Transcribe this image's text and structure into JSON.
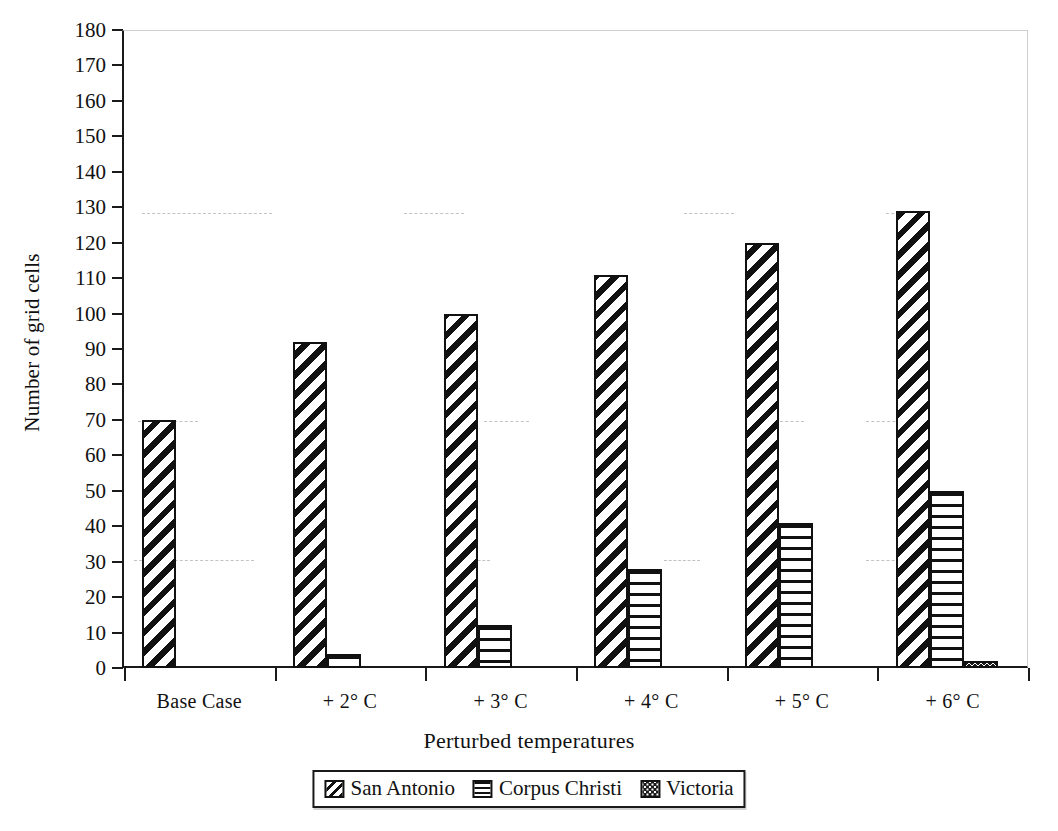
{
  "chart_data": {
    "type": "bar",
    "title": "",
    "xlabel": "Perturbed temperatures",
    "ylabel": "Number of grid cells",
    "ylim": [
      0,
      180
    ],
    "ytick_step": 10,
    "yticks": [
      180,
      170,
      160,
      150,
      140,
      130,
      120,
      110,
      100,
      90,
      80,
      70,
      60,
      50,
      40,
      30,
      20,
      10,
      0
    ],
    "categories": [
      "Base Case",
      "+ 2° C",
      "+ 3° C",
      "+ 4° C",
      "+ 5° C",
      "+ 6° C"
    ],
    "series": [
      {
        "name": "San Antonio",
        "pattern": "diagonal-hatch",
        "values": [
          70,
          92,
          100,
          111,
          120,
          129
        ]
      },
      {
        "name": "Corpus Christi",
        "pattern": "horizontal-lines",
        "values": [
          0,
          4,
          12,
          28,
          41,
          50
        ]
      },
      {
        "name": "Victoria",
        "pattern": "dotted-stipple",
        "values": [
          0,
          0,
          0,
          0,
          0,
          2
        ]
      }
    ],
    "grid": false,
    "legend_position": "bottom-center"
  },
  "axes": {
    "y_title": "Number of grid cells",
    "x_title": "Perturbed temperatures"
  },
  "legend": {
    "items": [
      {
        "label": "San Antonio"
      },
      {
        "label": "Corpus Christi"
      },
      {
        "label": "Victoria"
      }
    ]
  }
}
